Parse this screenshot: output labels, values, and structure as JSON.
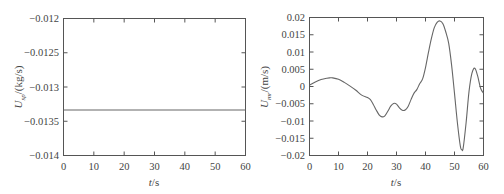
{
  "chart_data": [
    {
      "type": "line",
      "title": "",
      "xlabel": "t/s",
      "ylabel": "U_sp/(kg/s)",
      "ylabel_main": "U",
      "ylabel_sub": "sp",
      "ylabel_unit": "/(kg/s)",
      "xlim": [
        0,
        60
      ],
      "ylim": [
        -0.014,
        -0.012
      ],
      "xticks": [
        0,
        10,
        20,
        30,
        40,
        50,
        60
      ],
      "xtick_labels": [
        "0",
        "10",
        "20",
        "30",
        "40",
        "50",
        "60"
      ],
      "yticks": [
        -0.012,
        -0.0125,
        -0.013,
        -0.0135,
        -0.014
      ],
      "ytick_labels": [
        "-0.012",
        "-0.0125",
        "-0.013",
        "-0.0135",
        "-0.014"
      ],
      "grid": false,
      "legend": null,
      "series": [
        {
          "name": "U_sp",
          "x": [
            0,
            60
          ],
          "y": [
            -0.013335,
            -0.013335
          ]
        }
      ]
    },
    {
      "type": "line",
      "title": "",
      "xlabel": "t/s",
      "ylabel": "U_mr/(m/s)",
      "ylabel_main": "U",
      "ylabel_sub": "mr",
      "ylabel_unit": "/(m/s)",
      "xlim": [
        0,
        60
      ],
      "ylim": [
        -0.02,
        0.02
      ],
      "xticks": [
        0,
        10,
        20,
        30,
        40,
        50,
        60
      ],
      "xtick_labels": [
        "0",
        "10",
        "20",
        "30",
        "40",
        "50",
        "60"
      ],
      "yticks": [
        0.02,
        0.015,
        0.01,
        0.005,
        0,
        -0.005,
        -0.01,
        -0.015,
        -0.02
      ],
      "ytick_labels": [
        "0.02",
        "0.015",
        "0.01",
        "0.005",
        "0",
        "-0.005",
        "-0.01",
        "-0.015",
        "-0.02"
      ],
      "grid": false,
      "legend": null,
      "series": [
        {
          "name": "U_mr",
          "x": [
            0,
            2,
            4,
            6,
            7,
            8,
            10,
            12,
            14,
            16,
            18,
            20,
            21,
            22,
            23,
            24,
            25,
            26,
            27,
            28,
            29,
            30,
            31,
            32,
            33,
            34,
            35,
            36,
            37,
            38,
            39,
            40,
            41,
            42,
            43,
            44,
            45,
            46,
            47,
            48,
            49,
            50,
            51,
            52,
            52.5,
            53,
            54,
            55,
            56,
            57,
            58,
            59,
            60
          ],
          "y": [
            0.0004,
            0.0013,
            0.002,
            0.0024,
            0.0025,
            0.0025,
            0.0021,
            0.0012,
            0.0001,
            -0.0011,
            -0.0025,
            -0.0032,
            -0.0038,
            -0.0052,
            -0.0068,
            -0.0082,
            -0.0088,
            -0.0085,
            -0.0072,
            -0.0057,
            -0.0049,
            -0.0051,
            -0.0062,
            -0.0069,
            -0.0068,
            -0.0058,
            -0.0038,
            -0.002,
            -0.0009,
            0.0008,
            0.0022,
            0.0055,
            0.0098,
            0.0138,
            0.017,
            0.0186,
            0.019,
            0.0182,
            0.0158,
            0.0125,
            0.0062,
            -0.002,
            -0.0105,
            -0.0172,
            -0.0183,
            -0.0178,
            -0.0105,
            -0.0015,
            0.0038,
            0.0053,
            0.003,
            -0.0005,
            -0.0019
          ]
        }
      ]
    }
  ],
  "left_chart": {
    "ylabel_main": "U",
    "ylabel_sub": "sp",
    "ylabel_unit": "/(kg/s)",
    "xlabel_var": "t",
    "xlabel_unit": "/s",
    "xtick_labels": [
      "0",
      "10",
      "20",
      "30",
      "40",
      "50",
      "60"
    ],
    "ytick_labels": [
      "−0.012",
      "−0.0125",
      "−0.013",
      "−0.0135",
      "−0.014"
    ]
  },
  "right_chart": {
    "ylabel_main": "U",
    "ylabel_sub": "mr",
    "ylabel_unit": "/(m/s)",
    "xlabel_var": "t",
    "xlabel_unit": "/s",
    "xtick_labels": [
      "0",
      "10",
      "20",
      "30",
      "40",
      "50",
      "60"
    ],
    "ytick_labels": [
      "0.02",
      "0.015",
      "0.01",
      "0.005",
      "0",
      "−0.005",
      "−0.01",
      "−0.015",
      "−0.02"
    ]
  },
  "colors": {
    "line": "#666666",
    "axis": "#555555",
    "text": "#444444"
  }
}
